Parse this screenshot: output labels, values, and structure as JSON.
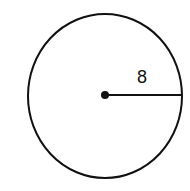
{
  "diagram": {
    "shape": "circle",
    "radius_label": "8",
    "stroke_color": "#111111",
    "background": "#ffffff"
  }
}
